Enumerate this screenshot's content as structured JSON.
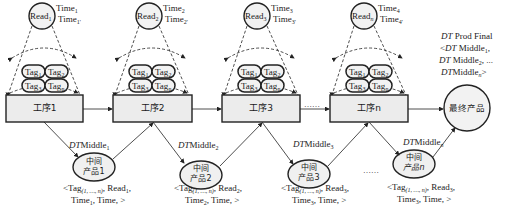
{
  "stations": [
    {
      "box": "工序1",
      "reader": "Read",
      "reader_sub": "1",
      "time_a": "Time",
      "time_a_sub": "1",
      "time_b": "Time",
      "time_b_sub": "1'",
      "tags": [
        {
          "t": "Tag",
          "s": "1"
        },
        {
          "t": "Tag",
          "s": "2"
        },
        {
          "t": "Tag",
          "s": "3"
        },
        {
          "t": "Tag",
          "s": "n"
        }
      ]
    },
    {
      "box": "工序2",
      "reader": "Read",
      "reader_sub": "2",
      "time_a": "Time",
      "time_a_sub": "2",
      "time_b": "Time",
      "time_b_sub": "2'",
      "tags": [
        {
          "t": "Tag",
          "s": "1"
        },
        {
          "t": "Tag",
          "s": "2"
        },
        {
          "t": "Tag",
          "s": "3"
        },
        {
          "t": "Tag",
          "s": "n"
        }
      ]
    },
    {
      "box": "工序3",
      "reader": "Read",
      "reader_sub": "3",
      "time_a": "Time",
      "time_a_sub": "3",
      "time_b": "Time",
      "time_b_sub": "3'",
      "tags": [
        {
          "t": "Tag",
          "s": "1"
        },
        {
          "t": "Tag",
          "s": "2"
        },
        {
          "t": "Tag",
          "s": "3"
        },
        {
          "t": "Tag",
          "s": "n"
        }
      ]
    },
    {
      "box": "工序n",
      "reader": "Read",
      "reader_sub": "n",
      "time_a": "Time",
      "time_a_sub": "4",
      "time_b": "Time",
      "time_b_sub": "4'",
      "tags": [
        {
          "t": "Tag",
          "s": "1"
        },
        {
          "t": "Tag",
          "s": "2"
        },
        {
          "t": "Tag",
          "s": "3"
        },
        {
          "t": "Tag",
          "s": "n"
        }
      ]
    }
  ],
  "ellipsis": "……",
  "final_product": "最终产品",
  "final_caption": {
    "line1_it": "DT",
    "line1": " Prod Final",
    "line2_pre": "<",
    "line2_it": "DT",
    "line2": " Middle",
    "line2_sub": "1",
    "line2_post": ",",
    "line3_it": "DT",
    "line3": " Middle",
    "line3_sub": "2",
    "line3_post": ", ...",
    "line4_it": "DT",
    "line4": "Middle",
    "line4_sub": "n",
    "line4_post": ">"
  },
  "middles": [
    {
      "label_it": "DT",
      "label": "Middle",
      "label_sub": "1",
      "line1": "中间",
      "line2": "产品1",
      "rec1_pre": "<Tag",
      "rec1_sub": "(1, …, n)",
      "rec1_post": ", Read",
      "rec1_rsub": "1",
      "rec1_end": ",",
      "rec2_pre": "Time",
      "rec2_sub": "1",
      "rec2_post": ", Time, >"
    },
    {
      "label_it": "DT",
      "label": "Middle",
      "label_sub": "2",
      "line1": "中间",
      "line2": "产品2",
      "rec1_pre": "<Tag",
      "rec1_sub": "(1, …, n)",
      "rec1_post": ", Read",
      "rec1_rsub": "2",
      "rec1_end": ",",
      "rec2_pre": "Time",
      "rec2_sub": "2",
      "rec2_post": ", Time, >"
    },
    {
      "label_it": "DT",
      "label": "Middle",
      "label_sub": "3",
      "line1": "中间",
      "line2": "产品3",
      "rec1_pre": "<Tag",
      "rec1_sub": "(1, …, n)",
      "rec1_post": ", Read",
      "rec1_rsub": "3",
      "rec1_end": ",",
      "rec2_pre": "Time",
      "rec2_sub": "3",
      "rec2_post": ", Time, >"
    },
    {
      "label_it": "DT",
      "label": "Middle",
      "label_sub": "n",
      "line1": "中间",
      "line2": "产品n",
      "rec1_pre": "<Tag",
      "rec1_sub": "(1, …, n)",
      "rec1_post": ", Read",
      "rec1_rsub": "3",
      "rec1_end": ",",
      "rec2_pre": "Time",
      "rec2_sub": "3",
      "rec2_post": ", Time, >"
    }
  ],
  "colors": {
    "box_fill": "#ececec",
    "stroke": "#222222",
    "ellipse_fill": "#f0f0f0"
  }
}
